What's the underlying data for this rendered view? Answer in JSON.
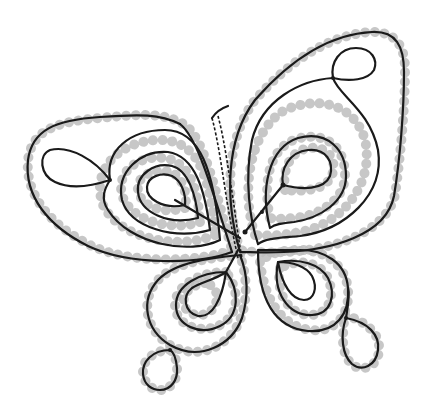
{
  "illustration": {
    "subject": "butterfly lace pattern",
    "colors": {
      "background": "#ffffff",
      "thread": "#1a1a1a",
      "pinholes": "#bdbdbd"
    },
    "parts": [
      "upper-left-wing",
      "upper-right-wing",
      "lower-left-wing",
      "lower-right-wing",
      "body"
    ]
  }
}
